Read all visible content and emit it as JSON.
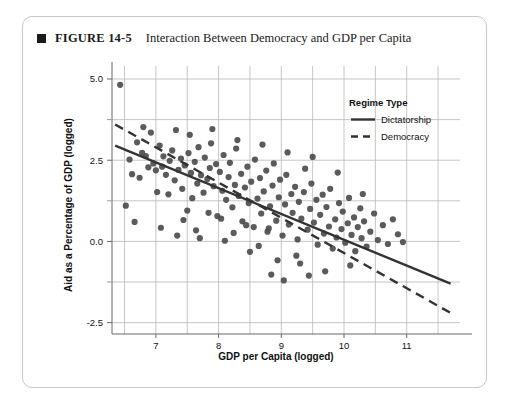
{
  "figure": {
    "bullet_icon": "square-bullet-icon",
    "number": "FIGURE 14-5",
    "title": "Interaction Between Democracy and GDP per Capita"
  },
  "chart_data": {
    "type": "scatter",
    "title": "Interaction Between Democracy and GDP per Capita",
    "xlabel": "GDP per Capita (logged)",
    "ylabel": "Aid as a Percentage of GDP (logged)",
    "xlim": [
      6.3,
      11.85
    ],
    "ylim": [
      -2.85,
      5.4
    ],
    "xticks": [
      7,
      8,
      9,
      10,
      11
    ],
    "xtick_labels": [
      "7",
      "8",
      "9",
      "10",
      "11"
    ],
    "yticks": [
      -2.5,
      0.0,
      2.5,
      5.0
    ],
    "ytick_labels": [
      "-2.5",
      "0.0",
      "2.5",
      "5.0"
    ],
    "x_minor_ticks": [
      6.5,
      7.5,
      8.5,
      9.5,
      10.5,
      11.5
    ],
    "y_minor_ticks": [
      -1.25,
      1.25,
      3.75
    ],
    "grid": true,
    "grid_color": "#b8b8b8",
    "point_color": "#4d4d4d",
    "point_radius": 3.1,
    "legend": {
      "title": "Regime Type",
      "position": "top-right-inside",
      "entries": [
        {
          "label": "Dictatorship",
          "style": "solid",
          "color": "#333333"
        },
        {
          "label": "Democracy",
          "style": "dashed",
          "color": "#333333"
        }
      ]
    },
    "fit_lines": [
      {
        "name": "Dictatorship",
        "style": "solid",
        "color": "#333333",
        "width": 2.4,
        "x0": 6.35,
        "y0": 2.95,
        "x1": 11.7,
        "y1": -1.3
      },
      {
        "name": "Democracy",
        "style": "dashed",
        "color": "#333333",
        "width": 2.4,
        "dash": "9 6",
        "x0": 6.35,
        "y0": 3.6,
        "x1": 11.7,
        "y1": -2.2
      }
    ],
    "points": [
      [
        6.43,
        4.82
      ],
      [
        6.58,
        2.52
      ],
      [
        6.62,
        2.07
      ],
      [
        6.7,
        3.05
      ],
      [
        6.74,
        1.96
      ],
      [
        6.78,
        2.73
      ],
      [
        6.84,
        2.63
      ],
      [
        6.88,
        2.28
      ],
      [
        6.92,
        3.35
      ],
      [
        6.96,
        2.4
      ],
      [
        7.0,
        2.19
      ],
      [
        7.02,
        1.52
      ],
      [
        7.06,
        2.95
      ],
      [
        7.1,
        2.3
      ],
      [
        7.12,
        2.62
      ],
      [
        7.16,
        2.05
      ],
      [
        7.2,
        1.45
      ],
      [
        7.22,
        2.48
      ],
      [
        7.26,
        2.8
      ],
      [
        7.3,
        1.88
      ],
      [
        7.32,
        3.43
      ],
      [
        7.36,
        2.2
      ],
      [
        7.4,
        2.55
      ],
      [
        7.42,
        1.62
      ],
      [
        7.46,
        2.34
      ],
      [
        7.5,
        0.95
      ],
      [
        7.52,
        2.72
      ],
      [
        7.56,
        2.11
      ],
      [
        7.58,
        1.33
      ],
      [
        7.62,
        2.45
      ],
      [
        7.66,
        1.78
      ],
      [
        7.68,
        2.9
      ],
      [
        7.72,
        2.04
      ],
      [
        7.76,
        1.5
      ],
      [
        7.78,
        2.58
      ],
      [
        7.82,
        1.92
      ],
      [
        7.86,
        2.26
      ],
      [
        7.88,
        3.02
      ],
      [
        7.92,
        1.7
      ],
      [
        7.96,
        2.38
      ],
      [
        7.98,
        0.78
      ],
      [
        8.02,
        2.14
      ],
      [
        8.06,
        1.56
      ],
      [
        8.08,
        2.66
      ],
      [
        8.12,
        1.28
      ],
      [
        8.16,
        1.98
      ],
      [
        8.18,
        2.42
      ],
      [
        8.22,
        1.05
      ],
      [
        8.26,
        1.74
      ],
      [
        8.28,
        2.86
      ],
      [
        8.32,
        1.4
      ],
      [
        8.36,
        2.08
      ],
      [
        8.38,
        0.62
      ],
      [
        8.42,
        1.66
      ],
      [
        8.46,
        2.3
      ],
      [
        8.48,
        1.18
      ],
      [
        8.52,
        1.84
      ],
      [
        8.56,
        0.44
      ],
      [
        8.58,
        2.52
      ],
      [
        8.62,
        1.32
      ],
      [
        8.66,
        1.95
      ],
      [
        8.68,
        0.86
      ],
      [
        8.72,
        1.54
      ],
      [
        8.76,
        2.18
      ],
      [
        8.78,
        0.3
      ],
      [
        8.82,
        1.08
      ],
      [
        8.86,
        1.72
      ],
      [
        8.88,
        2.4
      ],
      [
        8.92,
        0.64
      ],
      [
        8.96,
        1.36
      ],
      [
        8.98,
        1.9
      ],
      [
        9.02,
        0.18
      ],
      [
        9.06,
        1.14
      ],
      [
        9.08,
        2.05
      ],
      [
        9.12,
        0.52
      ],
      [
        9.16,
        1.46
      ],
      [
        9.18,
        0.88
      ],
      [
        9.22,
        1.68
      ],
      [
        9.26,
        0.06
      ],
      [
        9.28,
        1.22
      ],
      [
        9.32,
        0.7
      ],
      [
        9.36,
        1.52
      ],
      [
        9.38,
        2.24
      ],
      [
        9.42,
        0.36
      ],
      [
        9.46,
        1.0
      ],
      [
        9.48,
        1.78
      ],
      [
        9.52,
        0.58
      ],
      [
        9.56,
        1.28
      ],
      [
        9.58,
        -0.1
      ],
      [
        9.62,
        0.82
      ],
      [
        9.66,
        1.44
      ],
      [
        9.68,
        0.24
      ],
      [
        9.72,
        1.06
      ],
      [
        9.76,
        0.46
      ],
      [
        9.78,
        1.62
      ],
      [
        9.82,
        -0.22
      ],
      [
        9.86,
        0.68
      ],
      [
        9.88,
        0.12
      ],
      [
        9.92,
        1.18
      ],
      [
        9.96,
        0.38
      ],
      [
        9.98,
        0.92
      ],
      [
        10.02,
        -0.04
      ],
      [
        10.06,
        0.56
      ],
      [
        10.08,
        1.34
      ],
      [
        10.12,
        0.2
      ],
      [
        10.16,
        0.74
      ],
      [
        10.18,
        -0.3
      ],
      [
        10.22,
        0.44
      ],
      [
        10.26,
        1.02
      ],
      [
        10.28,
        0.1
      ],
      [
        10.32,
        0.62
      ],
      [
        10.36,
        -0.16
      ],
      [
        10.42,
        0.3
      ],
      [
        10.48,
        0.86
      ],
      [
        10.54,
        0.04
      ],
      [
        10.62,
        0.5
      ],
      [
        10.7,
        -0.08
      ],
      [
        10.78,
        0.68
      ],
      [
        10.86,
        0.22
      ],
      [
        10.94,
        -0.02
      ],
      [
        6.52,
        1.1
      ],
      [
        6.66,
        0.6
      ],
      [
        6.8,
        3.52
      ],
      [
        7.08,
        0.42
      ],
      [
        7.34,
        0.18
      ],
      [
        7.54,
        3.28
      ],
      [
        7.7,
        0.1
      ],
      [
        7.9,
        3.46
      ],
      [
        8.1,
        0.02
      ],
      [
        8.3,
        3.12
      ],
      [
        8.5,
        -0.32
      ],
      [
        8.7,
        2.98
      ],
      [
        8.94,
        -0.58
      ],
      [
        9.1,
        2.74
      ],
      [
        9.3,
        -0.68
      ],
      [
        9.5,
        2.6
      ],
      [
        9.7,
        -0.92
      ],
      [
        9.9,
        2.12
      ],
      [
        10.1,
        -0.74
      ],
      [
        10.3,
        1.46
      ],
      [
        8.84,
        -1.02
      ],
      [
        9.04,
        -1.2
      ],
      [
        9.24,
        -0.44
      ],
      [
        9.44,
        -1.05
      ],
      [
        7.44,
        0.66
      ],
      [
        7.64,
        0.34
      ],
      [
        7.84,
        0.88
      ],
      [
        8.04,
        0.7
      ],
      [
        8.24,
        0.26
      ],
      [
        8.44,
        0.5
      ],
      [
        8.64,
        -0.14
      ],
      [
        8.8,
        0.4
      ]
    ]
  }
}
